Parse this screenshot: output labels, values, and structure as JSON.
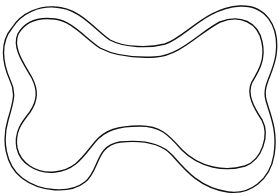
{
  "drawing": {
    "subject": "bone outline",
    "stroke_color": "#111111",
    "fill_color": "#ffffff",
    "background": "#ffffff",
    "stroke_width": 1.4,
    "outer_path": "M 12 28 C 22 12, 40 6, 55 7 C 80 8, 95 30, 110 40 C 125 48, 150 48, 165 44 C 185 38, 205 8, 240 6 C 265 5, 280 25, 276 55 C 273 75, 262 85, 266 100 C 270 115, 278 130, 274 155 C 270 180, 250 195, 228 192 C 200 188, 185 170, 172 155 C 160 142, 140 140, 120 142 C 95 146, 100 170, 85 182 C 70 194, 40 192, 22 178 C 5 165, 2 140, 8 120 C 14 100, 16 92, 10 80 C 2 62, 0 42, 12 28 Z",
    "inner_path": "M 18 34 C 26 20, 40 17, 55 19 C 72 21, 85 38, 100 48 C 115 56, 135 58, 155 57 C 180 56, 200 32, 220 22 C 240 14, 258 22, 262 42 C 266 60, 258 72, 252 82 C 246 94, 254 108, 262 120 C 270 135, 262 160, 245 166 C 225 172, 200 168, 182 150 C 168 134, 160 126, 140 126 C 118 126, 105 130, 95 142 C 82 158, 75 170, 55 172 C 35 174, 20 162, 17 148 C 14 132, 22 122, 30 112 C 38 100, 38 90, 32 78 C 24 64, 12 48, 18 34 Z"
  }
}
